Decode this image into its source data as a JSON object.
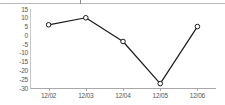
{
  "chart_data": {
    "type": "line",
    "title": "",
    "subtitle": "",
    "xlabel": "",
    "ylabel": "",
    "categories": [
      "12/02",
      "12/03",
      "12/04",
      "12/05",
      "12/06"
    ],
    "values": [
      6,
      10,
      -3.5,
      -27.5,
      5
    ],
    "series": [
      {
        "name": "",
        "values": [
          6,
          10,
          -3.5,
          -27.5,
          5
        ]
      }
    ],
    "ylim": [
      -30,
      15
    ],
    "yticks": [
      15,
      10,
      5,
      0,
      -5,
      -10,
      -15,
      -20,
      -25,
      -30
    ],
    "ytick_labels": [
      "15",
      "10",
      "5",
      "0",
      "-5",
      "-10",
      "-15",
      "-20",
      "-25",
      "-30"
    ],
    "xtick_labels": [
      "12/02",
      "12/03",
      "12/04",
      "12/05",
      "12/06"
    ],
    "grid": "horizontal-banded",
    "legend": "none",
    "marker": "open-circle",
    "line_color": "#1a1a1a",
    "marker_fill": "#ffffff",
    "marker_edge": "#1a1a1a",
    "band_color": "#e6e6e6",
    "axis_color": "#a8a8a8",
    "label_color": "#555555",
    "background": "#ffffff"
  }
}
